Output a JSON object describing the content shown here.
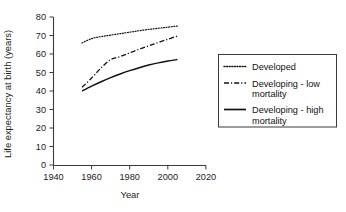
{
  "chart_data": {
    "type": "line",
    "title": "",
    "xlabel": "Year",
    "ylabel": "Life expectancy at birth (years)",
    "xlim": [
      1940,
      2020
    ],
    "ylim": [
      0,
      80
    ],
    "xticks": [
      1940,
      1960,
      1980,
      2000,
      2020
    ],
    "yticks": [
      0,
      10,
      20,
      30,
      40,
      50,
      60,
      70,
      80
    ],
    "grid": false,
    "legend_position": "right-outside",
    "x": [
      1955,
      1960,
      1965,
      1970,
      1975,
      1980,
      1985,
      1990,
      1995,
      2000,
      2005
    ],
    "series": [
      {
        "name": "Developed",
        "style": "dotted",
        "values": [
          66.0,
          68.3,
          69.4,
          70.2,
          71.0,
          71.8,
          72.6,
          73.3,
          73.9,
          74.5,
          75.1
        ]
      },
      {
        "name": "Developing - low mortality",
        "style": "dash-dot",
        "values": [
          42.0,
          47.0,
          52.5,
          57.0,
          58.6,
          60.6,
          62.6,
          64.4,
          66.2,
          68.0,
          69.7
        ]
      },
      {
        "name": "Developing - high mortality",
        "style": "solid",
        "values": [
          40.0,
          42.6,
          45.0,
          47.2,
          49.2,
          51.0,
          52.6,
          54.0,
          55.2,
          56.2,
          57.0
        ]
      }
    ]
  },
  "axes": {
    "y_title": "Life expectancy at birth (years)",
    "x_title": "Year",
    "x_tick_labels": [
      "1940",
      "1960",
      "1980",
      "2000",
      "2020"
    ],
    "y_tick_labels": [
      "80",
      "70",
      "60",
      "50",
      "40",
      "30",
      "20",
      "10",
      "0"
    ]
  },
  "legend": {
    "entries": [
      {
        "label_line1": "Developed",
        "label_line2": "",
        "style": "dotted"
      },
      {
        "label_line1": "Developing - low",
        "label_line2": "mortality",
        "style": "dash-dot"
      },
      {
        "label_line1": "Developing - high",
        "label_line2": "mortality",
        "style": "solid"
      }
    ]
  },
  "colors": {
    "line": "#111111",
    "axis": "#3a3a3a",
    "background": "#ffffff"
  }
}
